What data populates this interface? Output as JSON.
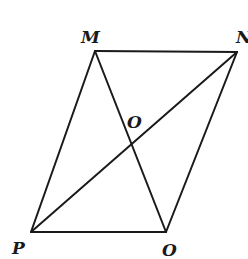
{
  "diagram": {
    "type": "parallelogram-with-diagonals",
    "background": "#ffffff",
    "stroke_color": "#1a1a1a",
    "vertices": {
      "M": {
        "label": "M",
        "x": 95,
        "y": 51
      },
      "N": {
        "label": "N",
        "x": 237,
        "y": 52
      },
      "P": {
        "label": "P",
        "x": 31,
        "y": 232
      },
      "Q": {
        "label": "O",
        "x": 166,
        "y": 232
      }
    },
    "intersection": {
      "label": "O",
      "x": 132,
      "y": 142
    },
    "edges": [
      [
        "M",
        "N"
      ],
      [
        "N",
        "Q"
      ],
      [
        "Q",
        "P"
      ],
      [
        "P",
        "M"
      ]
    ],
    "diagonals": [
      [
        "M",
        "Q"
      ],
      [
        "P",
        "N"
      ]
    ],
    "labels": {
      "M": "M",
      "N": "N",
      "P": "P",
      "Q": "O",
      "center": "O"
    }
  }
}
